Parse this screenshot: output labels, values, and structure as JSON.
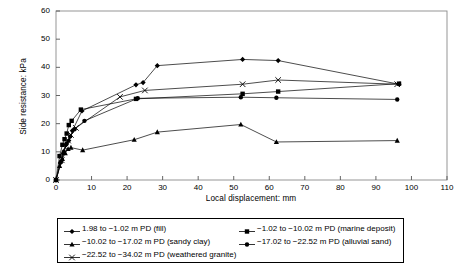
{
  "chart_data": {
    "type": "line",
    "title": "",
    "xlabel": "Local displacement: mm",
    "ylabel": "Side resistance: kPa",
    "xlim": [
      0,
      110
    ],
    "ylim": [
      0,
      60
    ],
    "xticks": [
      0,
      10,
      20,
      30,
      40,
      50,
      60,
      70,
      80,
      90,
      100,
      110
    ],
    "yticks": [
      0,
      10,
      20,
      30,
      40,
      50,
      60
    ],
    "grid": false,
    "legend_position": "below",
    "series": [
      {
        "name": "1.98 to −1.02 m PD (fill)",
        "marker": "diamond",
        "color": "#000000",
        "x": [
          0,
          1.2,
          2.0,
          2.8,
          3.6,
          4.6,
          7.3,
          22.5,
          24.5,
          28.5,
          52.5,
          62.5,
          96.5
        ],
        "y": [
          0,
          6.0,
          9.5,
          12.5,
          14.0,
          17.5,
          24.5,
          33.8,
          34.6,
          40.6,
          42.8,
          42.4,
          34.0
        ]
      },
      {
        "name": "−1.02 to −10.02 m PD (marine deposit)",
        "marker": "square",
        "color": "#000000",
        "x": [
          0,
          1.0,
          1.8,
          2.4,
          3.0,
          3.6,
          4.4,
          7.0,
          22.5,
          52.5,
          62.5,
          96.5
        ],
        "y": [
          0,
          8.5,
          12.5,
          14.5,
          16.5,
          19.5,
          21.0,
          25.0,
          28.8,
          30.6,
          31.4,
          34.2
        ]
      },
      {
        "name": "−10.02 to −17.02 m PD (sandy clay)",
        "marker": "triangle",
        "color": "#000000",
        "x": [
          0,
          1.0,
          1.8,
          2.6,
          3.4,
          4.2,
          7.5,
          22.0,
          28.5,
          52.0,
          62.0,
          96.0
        ],
        "y": [
          0,
          5.0,
          7.5,
          9.5,
          11.0,
          11.5,
          10.6,
          14.3,
          17.0,
          19.7,
          13.5,
          14.0
        ]
      },
      {
        "name": "−17.02 to −22.52 m PD (alluvial sand)",
        "marker": "circle",
        "color": "#000000",
        "x": [
          0,
          1.4,
          2.2,
          3.0,
          4.0,
          5.2,
          8.0,
          23.0,
          52.0,
          62.0,
          96.0
        ],
        "y": [
          0,
          6.5,
          10.0,
          13.0,
          15.5,
          18.0,
          21.0,
          29.0,
          29.4,
          29.2,
          28.6
        ]
      },
      {
        "name": "−22.52 to −34.02 m PD (weathered granite)",
        "marker": "cross",
        "color": "#000000",
        "x": [
          0,
          1.6,
          2.6,
          3.4,
          4.2,
          5.6,
          18.0,
          25.0,
          52.5,
          62.5,
          96.0
        ],
        "y": [
          0,
          7.0,
          11.5,
          14.0,
          16.0,
          18.5,
          29.5,
          31.8,
          34.0,
          35.5,
          34.0
        ]
      }
    ],
    "legend": [
      {
        "label": "1.98 to −1.02 m PD (fill)",
        "marker": "diamond"
      },
      {
        "label": "−1.02 to −10.02 m PD (marine deposit)",
        "marker": "square"
      },
      {
        "label": "−10.02 to −17.02 m PD (sandy clay)",
        "marker": "triangle"
      },
      {
        "label": "−17.02 to −22.52 m PD (alluvial sand)",
        "marker": "circle"
      },
      {
        "label": "−22.52 to −34.02 m PD (weathered granite)",
        "marker": "cross"
      }
    ]
  }
}
